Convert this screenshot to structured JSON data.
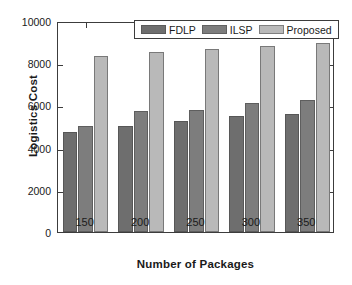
{
  "chart_data": {
    "type": "bar",
    "title": "",
    "xlabel": "Number of Packages",
    "ylabel": "Logistics Cost",
    "categories": [
      "150",
      "200",
      "250",
      "300",
      "350"
    ],
    "series": [
      {
        "name": "FDLP",
        "color": "#6e6e6e",
        "values": [
          4740,
          5030,
          5260,
          5500,
          5600
        ]
      },
      {
        "name": "ILSP",
        "color": "#7d7d7d",
        "values": [
          5020,
          5740,
          5780,
          6120,
          6260
        ]
      },
      {
        "name": "Proposed",
        "color": "#b9b9b9",
        "values": [
          8340,
          8530,
          8670,
          8820,
          8960
        ]
      }
    ],
    "ylim": [
      0,
      10000
    ],
    "yticks": [
      "0",
      "2000",
      "4000",
      "6000",
      "8000",
      "10000"
    ],
    "ytick_values": [
      0,
      2000,
      4000,
      6000,
      8000,
      10000
    ],
    "grid": false,
    "legend_position": "top-center",
    "axis_color": "#3c3c3c",
    "background_color": "#ffffff"
  }
}
